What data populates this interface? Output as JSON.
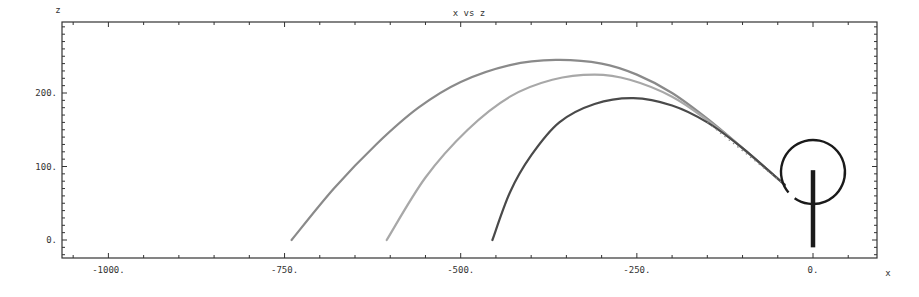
{
  "chart_data": {
    "type": "line",
    "title": "x vs z",
    "xlabel": "x",
    "ylabel": "z",
    "xlim": [
      -1060,
      90
    ],
    "ylim": [
      -25,
      295
    ],
    "x_ticks": [
      -1000,
      -750,
      -500,
      -250,
      0
    ],
    "x_tick_labels": [
      "-1000.",
      "-750.",
      "-500.",
      "-250.",
      "0."
    ],
    "y_ticks": [
      0,
      100,
      200
    ],
    "y_tick_labels": [
      "0.",
      "100.",
      "200."
    ],
    "grid": false,
    "legend": null,
    "series": [
      {
        "name": "trajectory-1",
        "color": "#8a8a8a",
        "points": [
          [
            -40,
            75
          ],
          [
            -100,
            125
          ],
          [
            -150,
            165
          ],
          [
            -200,
            200
          ],
          [
            -250,
            225
          ],
          [
            -300,
            240
          ],
          [
            -365,
            245
          ],
          [
            -430,
            238
          ],
          [
            -500,
            215
          ],
          [
            -560,
            180
          ],
          [
            -620,
            130
          ],
          [
            -680,
            70
          ],
          [
            -740,
            0
          ]
        ]
      },
      {
        "name": "trajectory-2",
        "color": "#a8a8a8",
        "points": [
          [
            -40,
            75
          ],
          [
            -100,
            125
          ],
          [
            -150,
            163
          ],
          [
            -200,
            195
          ],
          [
            -260,
            218
          ],
          [
            -310,
            225
          ],
          [
            -370,
            218
          ],
          [
            -430,
            195
          ],
          [
            -490,
            150
          ],
          [
            -550,
            85
          ],
          [
            -605,
            0
          ]
        ]
      },
      {
        "name": "trajectory-3",
        "color": "#4a4a4a",
        "points": [
          [
            -40,
            75
          ],
          [
            -100,
            125
          ],
          [
            -150,
            160
          ],
          [
            -200,
            183
          ],
          [
            -255,
            193
          ],
          [
            -310,
            185
          ],
          [
            -360,
            160
          ],
          [
            -400,
            115
          ],
          [
            -430,
            65
          ],
          [
            -455,
            0
          ]
        ]
      }
    ],
    "annotations": [
      {
        "type": "circle",
        "center": [
          0,
          90
        ],
        "radius_px": 32,
        "color": "#1a1a1a"
      },
      {
        "type": "vertical-bar",
        "x": 0,
        "z_range": [
          -10,
          95
        ],
        "color": "#1a1a1a"
      }
    ]
  }
}
